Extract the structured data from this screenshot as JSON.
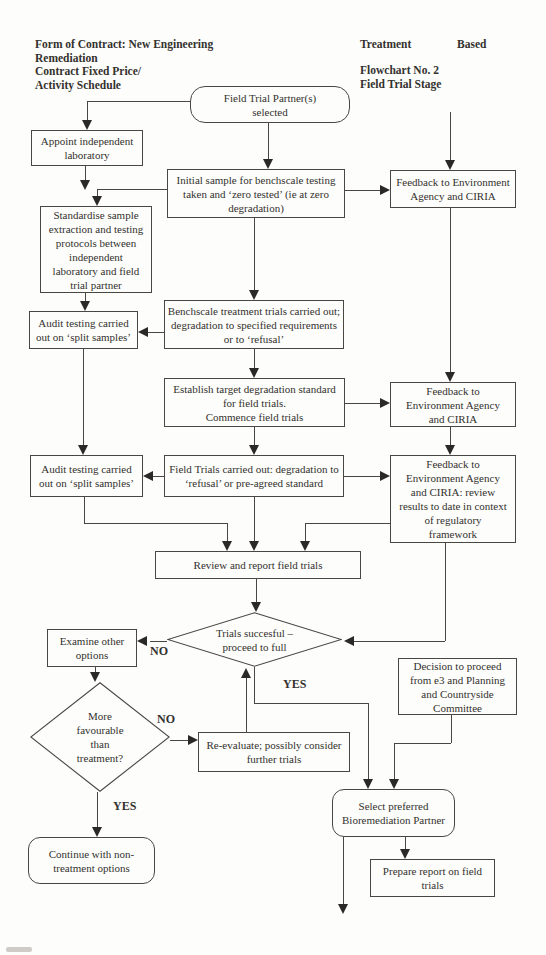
{
  "header": {
    "contract_lines": [
      "Form of Contract: New Engineering",
      "Remediation",
      "Contract Fixed Price/",
      "Activity Schedule"
    ],
    "treatment": "Treatment",
    "based": "Based",
    "flowchart_lines": [
      "Flowchart No. 2",
      "Field Trial Stage"
    ]
  },
  "nodes": {
    "field_trial_partner": {
      "lines": [
        "Field Trial Partner(s)",
        "selected"
      ]
    },
    "appoint_laboratory": {
      "lines": [
        "Appoint independent",
        "laboratory"
      ]
    },
    "feedback_1": {
      "lines": [
        "Feedback to Environment",
        "Agency and CIRIA"
      ]
    },
    "initial_sample": {
      "lines": [
        "Initial sample for benchscale testing",
        "taken and ‘zero tested’ (ie at zero",
        "degradation)"
      ]
    },
    "standardise_protocols": {
      "lines": [
        "Standardise sample",
        "extraction and testing",
        "protocols between",
        "independent",
        "laboratory and field",
        "trial partner"
      ]
    },
    "benchscale_trials": {
      "lines": [
        "Benchscale treatment trials carried out;",
        "degradation to specified requirements",
        "or to ‘refusal’"
      ]
    },
    "audit_testing_1": {
      "lines": [
        "Audit testing carried",
        "out on ‘split samples’"
      ]
    },
    "establish_standard": {
      "lines": [
        "Establish target degradation standard",
        "for field trials.",
        "Commence field trials"
      ]
    },
    "feedback_2": {
      "lines": [
        "Feedback to",
        "Environment Agency",
        "and CIRIA"
      ]
    },
    "audit_testing_2": {
      "lines": [
        "Audit testing carried",
        "out on ‘split samples’"
      ]
    },
    "field_trials": {
      "lines": [
        "Field Trials carried out: degradation to",
        "‘refusal’ or pre-agreed standard"
      ]
    },
    "feedback_3": {
      "lines": [
        "Feedback to",
        "Environment Agency",
        "and CIRIA: review",
        "results to date in context",
        "of regulatory",
        "framework"
      ]
    },
    "review_report": {
      "lines": [
        "Review and report field trials"
      ]
    },
    "trials_successful": {
      "lines": [
        "Trials succesful –",
        "proceed to full"
      ]
    },
    "examine_options": {
      "lines": [
        "Examine other",
        "options"
      ]
    },
    "decision_proceed": {
      "lines": [
        "Decision to proceed",
        "from e3 and Planning",
        "and Countryside",
        "Committee"
      ]
    },
    "more_favourable": {
      "lines": [
        "More",
        "favourable",
        "than",
        "treatment?"
      ]
    },
    "reevaluate": {
      "lines": [
        "Re-evaluate; possibly consider",
        "further trials"
      ]
    },
    "select_partner": {
      "lines": [
        "Select preferred",
        "Bioremediation Partner"
      ]
    },
    "continue_nontreatment": {
      "lines": [
        "Continue with non-",
        "treatment options"
      ]
    },
    "prepare_report": {
      "lines": [
        "Prepare report on field",
        "trials"
      ]
    }
  },
  "edge_labels": {
    "no_trials": "NO",
    "yes_trials": "YES",
    "no_favourable": "NO",
    "yes_favourable": "YES"
  }
}
